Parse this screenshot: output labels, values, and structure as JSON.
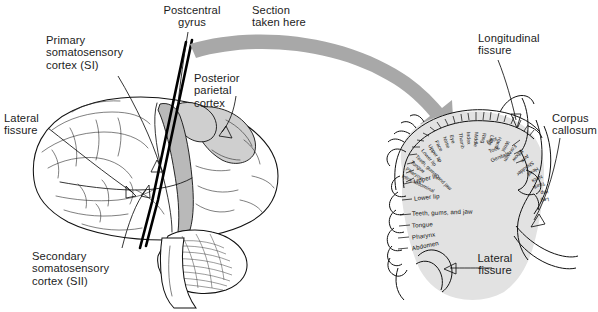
{
  "figure": {
    "accent_gray": "#b9b9b9",
    "section_fill": "#e2e2e2",
    "arrow_color": "#a8a8a8",
    "ink": "#111111"
  },
  "left_panel": {
    "view": "lateral view of left cerebral hemisphere",
    "labels": {
      "postcentral_gyrus": "Postcentral\ngyrus",
      "primary_somatosensory": "Primary\nsomatosensory\ncortex (SI)",
      "posterior_parietal": "Posterior\nparietal\ncortex",
      "lateral_fissure": "Lateral\nfissure",
      "secondary_somatosensory": "Secondary\nsomatosensory\ncortex (SII)"
    }
  },
  "section_arrow": {
    "label": "Section\ntaken here"
  },
  "right_panel": {
    "view": "coronal section through postcentral gyrus showing sensory homunculus",
    "labels": {
      "longitudinal_fissure": "Longitudinal\nfissure",
      "corpus_callosum": "Corpus\ncallosum",
      "lateral_fissure": "Lateral\nfissure"
    },
    "homunculus_arc": [
      "Intra-abdominal",
      "Pharynx",
      "Tongue",
      "Teeth, gums, and jaw",
      "Lower lip",
      "Upper lip",
      "Face",
      "Nose",
      "Eye",
      "Thumb",
      "Index",
      "Middle",
      "Ring",
      "Little",
      "Hand",
      "Wrist",
      "Forearm",
      "Elbow",
      "Arm",
      "Shoulder",
      "Head",
      "Neck",
      "Trunk",
      "Hip",
      "Leg"
    ],
    "homunculus_medial": [
      "Foot",
      "Toes",
      "Genitals"
    ],
    "homunculus_lateral_list": [
      "Upper lip",
      "Lower lip",
      "Teeth, gums, and jaw",
      "Tongue",
      "Pharynx",
      "Abdomen"
    ]
  }
}
